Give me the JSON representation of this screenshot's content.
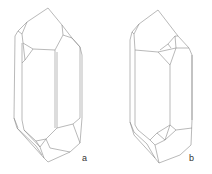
{
  "figure": {
    "panels": [
      {
        "id": "a",
        "label": "a",
        "description": "quartz crystal drawing, variant a"
      },
      {
        "id": "b",
        "label": "b",
        "description": "quartz crystal drawing, variant b"
      }
    ],
    "colors": {
      "line": "#8a8a8a",
      "background": "#ffffff",
      "label": "#333333"
    }
  }
}
